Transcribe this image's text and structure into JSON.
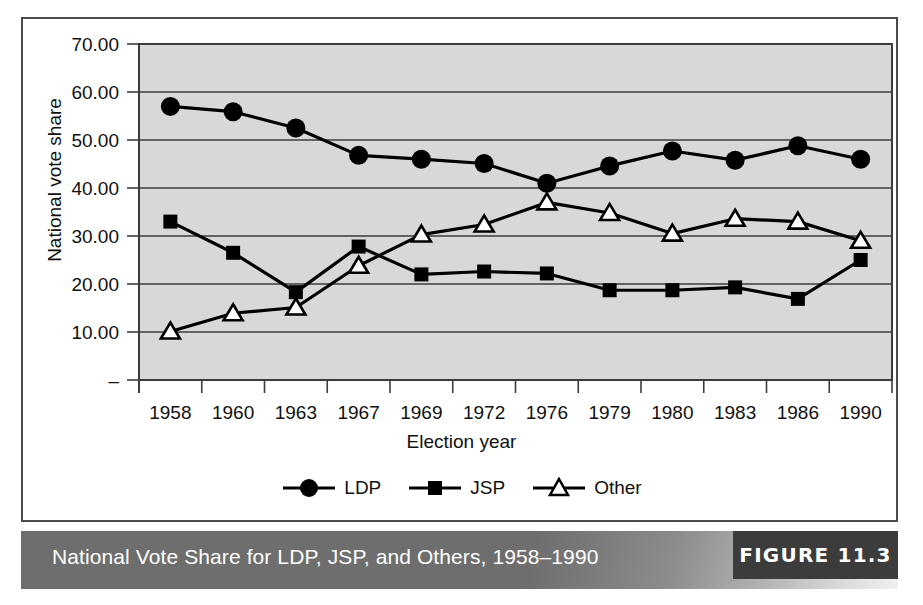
{
  "figure": {
    "caption": "National Vote Share for LDP, JSP, and Others, 1958–1990",
    "figure_number": "FIGURE 11.3"
  },
  "chart_data": {
    "type": "line",
    "title": "",
    "xlabel": "Election year",
    "ylabel": "National vote share",
    "categories": [
      "1958",
      "1960",
      "1963",
      "1967",
      "1969",
      "1972",
      "1976",
      "1979",
      "1980",
      "1983",
      "1986",
      "1990"
    ],
    "ylim": [
      0,
      70
    ],
    "yticks": [
      0,
      10,
      20,
      30,
      40,
      50,
      60,
      70
    ],
    "ytick_labels": [
      "–",
      "10.00",
      "20.00",
      "30.00",
      "40.00",
      "50.00",
      "60.00",
      "70.00"
    ],
    "grid": true,
    "grid_axis": "y",
    "legend_position": "bottom",
    "plot_background": "#d8d8d8",
    "series": [
      {
        "name": "LDP",
        "marker": "filled-circle",
        "color": "#000000",
        "values": [
          57.0,
          55.9,
          52.5,
          46.8,
          46.0,
          45.1,
          41.0,
          44.6,
          47.7,
          45.8,
          48.8,
          46.0
        ]
      },
      {
        "name": "JSP",
        "marker": "filled-square",
        "color": "#000000",
        "values": [
          33.0,
          26.5,
          18.3,
          27.8,
          22.0,
          22.6,
          22.2,
          18.7,
          18.7,
          19.3,
          16.9,
          25.0
        ]
      },
      {
        "name": "Other",
        "marker": "open-triangle",
        "color": "#000000",
        "values": [
          10.1,
          13.9,
          15.1,
          23.8,
          30.3,
          32.4,
          37.0,
          34.8,
          30.5,
          33.6,
          33.0,
          29.0
        ]
      }
    ]
  }
}
